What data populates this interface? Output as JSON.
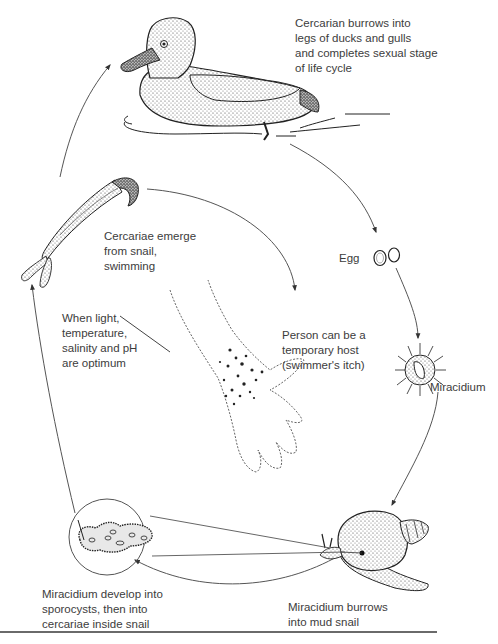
{
  "diagram": {
    "stages": {
      "duck": {
        "lines": [
          "Cercarian burrows into",
          "legs of ducks and gulls",
          "and completes sexual stage",
          "of life cycle"
        ]
      },
      "egg": {
        "lines": [
          "Egg"
        ]
      },
      "miracidium": {
        "lines": [
          "Miracidium"
        ]
      },
      "snail": {
        "lines": [
          "Miracidium burrows",
          "into mud snail"
        ]
      },
      "sporocyst": {
        "lines": [
          "Miracidium develop into",
          "sporocysts, then into",
          "cercariae inside snail"
        ]
      },
      "conditions": {
        "lines": [
          "When light,",
          "temperature,",
          "salinity and pH",
          "are optimum"
        ]
      },
      "cercariae": {
        "lines": [
          "Cercariae emerge",
          "from snail,",
          "swimming"
        ]
      },
      "human": {
        "lines": [
          "Person can be a",
          "temporary host",
          "(swimmer's itch)"
        ]
      }
    },
    "icons": [
      "duck-illustration",
      "egg-illustration",
      "miracidium-illustration",
      "snail-illustration",
      "sporocyst-illustration",
      "cercaria-illustration",
      "hand-illustration"
    ],
    "colors": {
      "ink": "#2a2a2a",
      "arrow": "#555555",
      "text": "#3c3c3c",
      "rule": "#6a6a6a"
    }
  }
}
